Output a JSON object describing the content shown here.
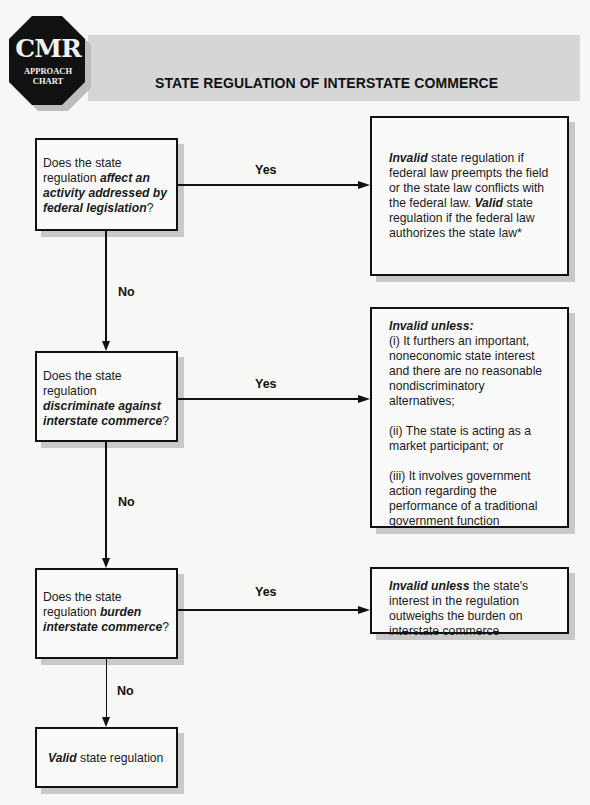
{
  "header": {
    "logo": {
      "main": "CMR",
      "line1": "APPROACH",
      "line2": "CHART"
    },
    "title": "STATE REGULATION OF INTERSTATE COMMERCE"
  },
  "colors": {
    "band": "#d6d6d6",
    "logo_fill": "#111111",
    "box_border": "#111111",
    "shadow": "#c9c9c9"
  },
  "flow": {
    "q1": {
      "pre": "Does the state regulation ",
      "emph": "affect an activity addressed by federal legislation",
      "post": "?"
    },
    "q2": {
      "pre": "Does the state regulation ",
      "emph": "discriminate against interstate commerce",
      "post": "?"
    },
    "q3": {
      "pre": "Does the state regulation ",
      "emph": "burden interstate commerce",
      "post": "?"
    },
    "end": {
      "emph": "Valid",
      "post": " state regulation"
    },
    "yes_label": "Yes",
    "no_label": "No",
    "r1": {
      "emph1": "Invalid",
      "text1": " state regulation if federal law preempts the field or the state law conflicts with the federal law. ",
      "emph2": "Valid",
      "text2": " state regulation if the federal law authorizes the state law*"
    },
    "r2": {
      "heading": "Invalid unless:",
      "items": [
        "(i) It furthers an important, noneconomic state interest and there are no reasonable nondiscriminatory alternatives;",
        "(ii) The state is acting as a market participant; or",
        "(iii) It involves government action regarding the performance of a traditional government function"
      ]
    },
    "r3": {
      "emph": "Invalid unless",
      "text": " the state's interest in the regulation outweighs the burden on interstate commerce"
    }
  }
}
